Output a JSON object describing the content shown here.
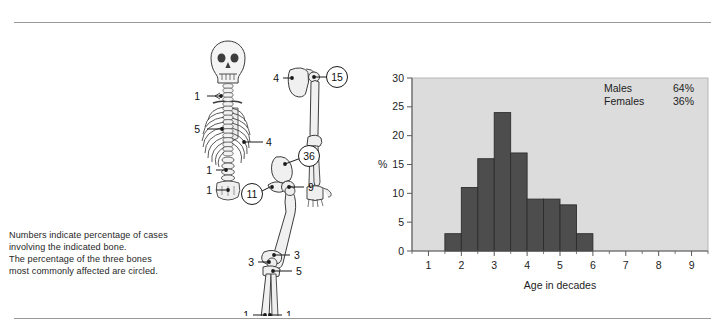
{
  "figure": {
    "caption_lines": [
      "Numbers indicate percentage of cases",
      "involving the indicated bone.",
      "The percentage of the three bones",
      "most commonly affected are circled."
    ]
  },
  "skeleton": {
    "title": "skeleton-diagram",
    "labels": [
      {
        "id": "clavicle",
        "value": "1",
        "circled": false
      },
      {
        "id": "ribs",
        "value": "5",
        "circled": false
      },
      {
        "id": "thoracic-spine",
        "value": "4",
        "circled": false
      },
      {
        "id": "lumbar-spine",
        "value": "1",
        "circled": false
      },
      {
        "id": "sacrum",
        "value": "1",
        "circled": false
      },
      {
        "id": "scapula",
        "value": "4",
        "circled": false
      },
      {
        "id": "proximal-humerus",
        "value": "15",
        "circled": true
      },
      {
        "id": "ilium",
        "value": "36",
        "circled": true
      },
      {
        "id": "pubis",
        "value": "11",
        "circled": true
      },
      {
        "id": "femoral-neck",
        "value": "9",
        "circled": false
      },
      {
        "id": "distal-femur",
        "value": "3",
        "circled": false
      },
      {
        "id": "proximal-tibia",
        "value": "3",
        "circled": false
      },
      {
        "id": "tibia-shaft",
        "value": "5",
        "circled": false
      },
      {
        "id": "distal-tibia",
        "value": "1",
        "circled": false
      },
      {
        "id": "distal-fibula",
        "value": "1",
        "circled": false
      }
    ]
  },
  "chart_data": {
    "type": "bar",
    "title": "",
    "xlabel": "Age in decades",
    "ylabel": "%",
    "xlim": [
      0.5,
      9.5
    ],
    "ylim": [
      0,
      30
    ],
    "grid": false,
    "legend_position": "top-right",
    "xticks": [
      "1",
      "2",
      "3",
      "4",
      "5",
      "6",
      "7",
      "8",
      "9"
    ],
    "xtick_values": [
      1,
      2,
      3,
      4,
      5,
      6,
      7,
      8,
      9
    ],
    "yticks": [
      "0",
      "5",
      "10",
      "15",
      "20",
      "25",
      "30"
    ],
    "ytick_values": [
      0,
      5,
      10,
      15,
      20,
      25,
      30
    ],
    "bin_edges": [
      1.5,
      2.0,
      2.5,
      3.0,
      3.5,
      4.0,
      4.5,
      5.0,
      5.5,
      6.0
    ],
    "categories": [
      "1.5-2.0",
      "2.0-2.5",
      "2.5-3.0",
      "3.0-3.5",
      "3.5-4.0",
      "4.0-4.5",
      "4.5-5.0",
      "5.0-5.5",
      "5.5-6.0"
    ],
    "values": [
      3,
      11,
      16,
      24,
      17,
      9,
      9,
      8,
      3
    ],
    "bar_color": "#4d4d4d",
    "plot_background": "#dcdcdc",
    "annotations": [
      {
        "label": "Males",
        "value": "64%"
      },
      {
        "label": "Females",
        "value": "36%"
      }
    ]
  }
}
